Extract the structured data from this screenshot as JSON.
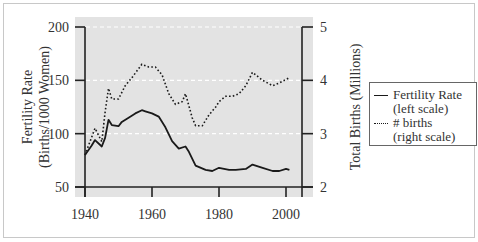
{
  "chart_data": {
    "type": "line",
    "title": "",
    "xlabel": "",
    "ylabel": "Fertility Rate (Births/1000 Women)",
    "y2label": "Total Births (Millions)",
    "xlim": [
      1940,
      2005
    ],
    "ylim": [
      50,
      200
    ],
    "y2lim": [
      2,
      5
    ],
    "x_ticks": [
      1940,
      1960,
      1980,
      2000
    ],
    "y_ticks": [
      50,
      100,
      150,
      200
    ],
    "y2_ticks": [
      2,
      3,
      4,
      5
    ],
    "grid": "horizontal dashed white at 100, 150, 200",
    "background": "#e3e3e3",
    "legend_position": "right, outside plot",
    "series": [
      {
        "name": "Fertility Rate (left scale)",
        "axis": "left",
        "style": "solid",
        "x": [
          1940,
          1942,
          1943,
          1945,
          1946,
          1947,
          1948,
          1950,
          1951,
          1953,
          1955,
          1957,
          1958,
          1960,
          1962,
          1964,
          1966,
          1968,
          1970,
          1971,
          1973,
          1976,
          1978,
          1980,
          1983,
          1985,
          1988,
          1990,
          1993,
          1996,
          1998,
          2000,
          2001
        ],
        "values": [
          80,
          89,
          94,
          88,
          96,
          113,
          108,
          107,
          111,
          115,
          119,
          122,
          121,
          119,
          116,
          106,
          93,
          86,
          88,
          83,
          70,
          66,
          65,
          68,
          66,
          66,
          67,
          71,
          68,
          65,
          65,
          67,
          66
        ]
      },
      {
        "name": "# births (right scale)",
        "axis": "right",
        "style": "dotted",
        "x": [
          1940,
          1943,
          1945,
          1946,
          1947,
          1948,
          1950,
          1952,
          1954,
          1957,
          1959,
          1961,
          1963,
          1965,
          1967,
          1969,
          1970,
          1972,
          1973,
          1975,
          1977,
          1979,
          1980,
          1982,
          1984,
          1986,
          1988,
          1990,
          1993,
          1996,
          1998,
          2001
        ],
        "values": [
          2.6,
          3.1,
          2.85,
          3.4,
          3.85,
          3.65,
          3.65,
          3.9,
          4.05,
          4.3,
          4.25,
          4.25,
          4.1,
          3.75,
          3.55,
          3.6,
          3.75,
          3.3,
          3.15,
          3.15,
          3.35,
          3.5,
          3.6,
          3.7,
          3.7,
          3.75,
          3.9,
          4.15,
          4.0,
          3.9,
          3.95,
          4.05
        ]
      }
    ]
  },
  "axes": {
    "left_title_line1": "Fertility Rate",
    "left_title_line2": "(Births/1000 Women)",
    "right_title": "Total Births (Millions)",
    "left_ticks": [
      "200",
      "150",
      "100",
      "50"
    ],
    "right_ticks": [
      "5",
      "4",
      "3",
      "2"
    ],
    "x_ticks": [
      "1940",
      "1960",
      "1980",
      "2000"
    ]
  },
  "legend": {
    "items": [
      {
        "line1": "Fertility Rate",
        "line2": "(left scale)"
      },
      {
        "line1": "# births",
        "line2": "(right scale)"
      }
    ]
  },
  "colors": {
    "plot_bg": "#e3e3e3",
    "line": "#1a1a1a",
    "grid": "#ffffff"
  }
}
